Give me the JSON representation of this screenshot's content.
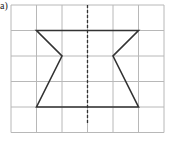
{
  "label": "a)",
  "grid": {
    "x0": 11,
    "y0": 5,
    "cell": 25.5,
    "cols": 6,
    "rows": 5,
    "color": "#b8b8b8"
  },
  "shape": {
    "points": [
      [
        1,
        1
      ],
      [
        5,
        1
      ],
      [
        4,
        2
      ],
      [
        5,
        4
      ],
      [
        1,
        4
      ],
      [
        2,
        2
      ]
    ],
    "stroke": "#333333"
  },
  "symmetry_line": {
    "x": 3,
    "y_start": 0,
    "y_end": 4.7,
    "style": "dashed",
    "color": "#333333"
  }
}
